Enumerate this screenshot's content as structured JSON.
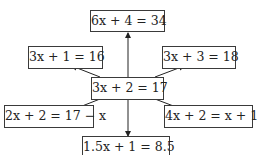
{
  "diagram": {
    "center": {
      "label": "3x + 2 = 17"
    },
    "nodes": [
      {
        "id": "top",
        "label": "6x + 4 = 34"
      },
      {
        "id": "upper-left",
        "label": "3x + 1 = 16"
      },
      {
        "id": "upper-right",
        "label": "3x + 3 = 18"
      },
      {
        "id": "lower-left",
        "label": "2x + 2 = 17 − x"
      },
      {
        "id": "lower-right",
        "label": "4x + 2 = x + 17"
      },
      {
        "id": "bottom",
        "label": "1.5x + 1 = 8.5"
      }
    ],
    "edges": [
      {
        "from": "center",
        "to": "top"
      },
      {
        "from": "center",
        "to": "upper-left"
      },
      {
        "from": "center",
        "to": "upper-right"
      },
      {
        "from": "center",
        "to": "lower-left"
      },
      {
        "from": "center",
        "to": "lower-right"
      },
      {
        "from": "center",
        "to": "bottom"
      }
    ],
    "colors": {
      "line": "#222222",
      "border": "#3a3a3a",
      "background": "#ffffff"
    }
  }
}
